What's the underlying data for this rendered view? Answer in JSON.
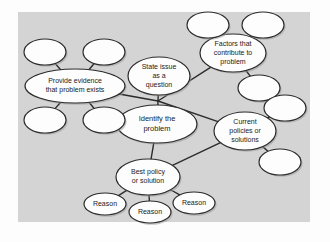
{
  "diagram": {
    "canvas": {
      "background_color": "#d4d4d4",
      "page_background_color": "#fdfdfd",
      "x": 18,
      "y": 12,
      "width": 292,
      "height": 210
    },
    "style": {
      "node_fill": "#fdfdfd",
      "node_stroke": "#2b2b2b",
      "edge_color": "#2b2b2b",
      "shadow_color": "#9a9a9a",
      "text_color": "#1b1b1b"
    },
    "nodes": [
      {
        "id": "identify",
        "label": "Identify the\nproblem",
        "lines": [
          "Identify the",
          "problem"
        ],
        "cx": 157,
        "cy": 124,
        "rx": 40,
        "ry": 19,
        "font_size": 7.5,
        "filled_label": true
      },
      {
        "id": "state-issue",
        "label": "State issue\nas a\nquestion",
        "lines": [
          "State issue",
          "as a",
          "question"
        ],
        "cx": 159,
        "cy": 76,
        "rx": 31,
        "ry": 19,
        "font_size": 7,
        "filled_label": true
      },
      {
        "id": "provide-evidence",
        "label": "Provide evidence\nthat problem exists",
        "lines": [
          "Provide evidence",
          "that problem exists"
        ],
        "cx": 75,
        "cy": 86,
        "rx": 50,
        "ry": 17,
        "font_size": 7,
        "filled_label": true
      },
      {
        "id": "factors",
        "label": "Factors that\ncontribute to\nproblem",
        "lines": [
          "Factors that",
          "contribute to",
          "problem"
        ],
        "cx": 233,
        "cy": 53,
        "rx": 33,
        "ry": 19,
        "font_size": 7,
        "filled_label": true
      },
      {
        "id": "current-policies",
        "label": "Current\npolicies or\nsolutions",
        "lines": [
          "Current",
          "policies or",
          "solutions"
        ],
        "cx": 245,
        "cy": 131,
        "rx": 31,
        "ry": 19,
        "font_size": 7,
        "filled_label": true
      },
      {
        "id": "best-policy",
        "label": "Best policy\nor solution",
        "lines": [
          "Best policy",
          "or solution"
        ],
        "cx": 148,
        "cy": 177,
        "rx": 32,
        "ry": 18,
        "font_size": 7,
        "filled_label": true
      },
      {
        "id": "reason-left",
        "label": "Reason",
        "lines": [
          "Reason"
        ],
        "cx": 105,
        "cy": 204,
        "rx": 21,
        "ry": 11,
        "font_size": 7,
        "filled_label": true
      },
      {
        "id": "reason-center",
        "label": "Reason",
        "lines": [
          "Reason"
        ],
        "cx": 150,
        "cy": 212,
        "rx": 21,
        "ry": 11,
        "font_size": 7,
        "filled_label": true
      },
      {
        "id": "reason-right",
        "label": "Reason",
        "lines": [
          "Reason"
        ],
        "cx": 194,
        "cy": 203,
        "rx": 21,
        "ry": 11,
        "font_size": 7,
        "filled_label": true
      },
      {
        "id": "evidence-sat-top-left",
        "label": "",
        "lines": [],
        "cx": 45,
        "cy": 52,
        "rx": 21,
        "ry": 13,
        "font_size": 7,
        "filled_label": false
      },
      {
        "id": "evidence-sat-top-right",
        "label": "",
        "lines": [],
        "cx": 104,
        "cy": 52,
        "rx": 21,
        "ry": 13,
        "font_size": 7,
        "filled_label": false
      },
      {
        "id": "evidence-sat-bottom-left",
        "label": "",
        "lines": [],
        "cx": 45,
        "cy": 120,
        "rx": 21,
        "ry": 13,
        "font_size": 7,
        "filled_label": false
      },
      {
        "id": "evidence-sat-bottom-right",
        "label": "",
        "lines": [],
        "cx": 104,
        "cy": 120,
        "rx": 21,
        "ry": 13,
        "font_size": 7,
        "filled_label": false
      },
      {
        "id": "factors-sat-left",
        "label": "",
        "lines": [],
        "cx": 208,
        "cy": 25,
        "rx": 21,
        "ry": 13,
        "font_size": 7,
        "filled_label": false
      },
      {
        "id": "factors-sat-right",
        "label": "",
        "lines": [],
        "cx": 263,
        "cy": 25,
        "rx": 21,
        "ry": 13,
        "font_size": 7,
        "filled_label": false
      },
      {
        "id": "factors-sat-bottom",
        "label": "",
        "lines": [],
        "cx": 259,
        "cy": 88,
        "rx": 21,
        "ry": 13,
        "font_size": 7,
        "filled_label": false
      },
      {
        "id": "policies-sat-top",
        "label": "",
        "lines": [],
        "cx": 285,
        "cy": 108,
        "rx": 21,
        "ry": 13,
        "font_size": 7,
        "filled_label": false
      },
      {
        "id": "policies-sat-bottom",
        "label": "",
        "lines": [],
        "cx": 280,
        "cy": 162,
        "rx": 21,
        "ry": 13,
        "font_size": 7,
        "filled_label": false
      }
    ],
    "junction": {
      "x": 158,
      "y": 101
    },
    "edges": [
      {
        "id": "edge-state-issue-junction",
        "from": "state-issue",
        "to": "junction"
      },
      {
        "id": "edge-junction-identify",
        "from": "junction",
        "to": "identify"
      },
      {
        "id": "edge-provide-evidence-junction",
        "from": "provide-evidence",
        "to": "junction"
      },
      {
        "id": "edge-junction-factors",
        "from": "junction",
        "to": "factors"
      },
      {
        "id": "edge-junction-current-policies",
        "from": "junction",
        "to": "current-policies"
      },
      {
        "id": "edge-identify-best-policy",
        "from": "identify",
        "to": "best-policy"
      },
      {
        "id": "edge-best-policy-current-policies",
        "from": "best-policy",
        "to": "current-policies"
      },
      {
        "id": "edge-best-policy-reason-left",
        "from": "best-policy",
        "to": "reason-left"
      },
      {
        "id": "edge-best-policy-reason-center",
        "from": "best-policy",
        "to": "reason-center"
      },
      {
        "id": "edge-best-policy-reason-right",
        "from": "best-policy",
        "to": "reason-right"
      },
      {
        "id": "edge-evidence-sat-top-left",
        "from": "provide-evidence",
        "to": "evidence-sat-top-left"
      },
      {
        "id": "edge-evidence-sat-top-right",
        "from": "provide-evidence",
        "to": "evidence-sat-top-right"
      },
      {
        "id": "edge-evidence-sat-bottom-left",
        "from": "provide-evidence",
        "to": "evidence-sat-bottom-left"
      },
      {
        "id": "edge-evidence-sat-bottom-right",
        "from": "provide-evidence",
        "to": "evidence-sat-bottom-right"
      },
      {
        "id": "edge-factors-sat-left",
        "from": "factors",
        "to": "factors-sat-left"
      },
      {
        "id": "edge-factors-sat-right",
        "from": "factors",
        "to": "factors-sat-right"
      },
      {
        "id": "edge-factors-sat-bottom",
        "from": "factors",
        "to": "factors-sat-bottom"
      },
      {
        "id": "edge-policies-sat-top",
        "from": "current-policies",
        "to": "policies-sat-top"
      },
      {
        "id": "edge-policies-sat-bottom",
        "from": "current-policies",
        "to": "policies-sat-bottom"
      }
    ]
  }
}
